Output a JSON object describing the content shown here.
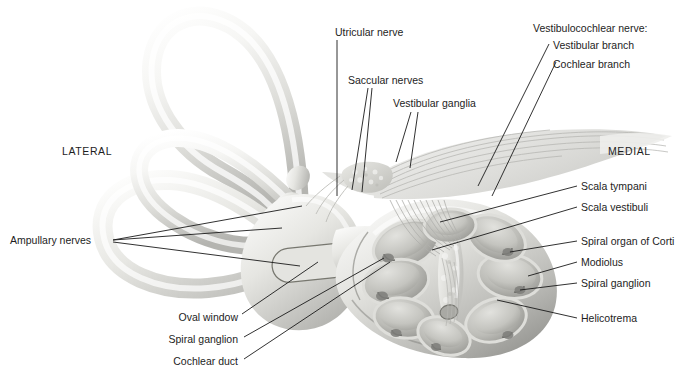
{
  "figure": {
    "kind": "anatomical-illustration",
    "background": "#ffffff",
    "leader_color": "#1a1a1a",
    "tissue_light": "#f2f2f0",
    "tissue_mid": "#c9c9c6",
    "tissue_dark": "#8e8e8b"
  },
  "orientation": {
    "lateral": "LATERAL",
    "medial": "MEDIAL"
  },
  "labels": {
    "utricular_nerve": "Utricular nerve",
    "saccular_nerves": "Saccular nerves",
    "vestibular_ganglia": "Vestibular ganglia",
    "vestibulocochlear_nerve": "Vestibulocochlear nerve:",
    "vestibular_branch": "Vestibular branch",
    "cochlear_branch": "Cochlear branch",
    "scala_tympani": "Scala tympani",
    "scala_vestibuli": "Scala vestibuli",
    "spiral_organ_of_corti": "Spiral organ of Corti",
    "modiolus": "Modiolus",
    "spiral_ganglion_right": "Spiral ganglion",
    "helicotrema": "Helicotrema",
    "ampullary_nerves": "Ampullary nerves",
    "oval_window": "Oval window",
    "spiral_ganglion_left": "Spiral ganglion",
    "cochlear_duct": "Cochlear duct"
  }
}
